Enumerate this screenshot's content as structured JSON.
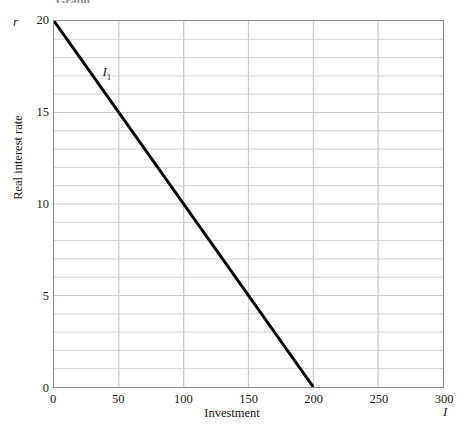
{
  "title_partial": "Graph",
  "chart_data": {
    "type": "line",
    "title": "",
    "xlabel": "Investment",
    "ylabel": "Real interest rate",
    "x_axis_symbol": "I",
    "y_axis_symbol": "r",
    "xlim": [
      0,
      300
    ],
    "ylim": [
      0,
      20
    ],
    "xticks": [
      0,
      50,
      100,
      150,
      200,
      250,
      300
    ],
    "xtick_labels": [
      "0",
      "50",
      "100",
      "150",
      "200",
      "250",
      "300"
    ],
    "yticks": [
      0,
      5,
      10,
      15,
      20
    ],
    "ytick_labels": [
      "0",
      "5",
      "10",
      "15",
      "20"
    ],
    "grid": true,
    "grid_x_step": 50,
    "grid_y_step": 1,
    "grid_color": "#c9c9c9",
    "frame_color": "#8c8c8c",
    "legend": "none",
    "series": [
      {
        "name": "I1",
        "label": "I",
        "label_subscript": "1",
        "color": "#000000",
        "line_width": 3,
        "points": [
          {
            "x": 0,
            "y": 20
          },
          {
            "x": 200,
            "y": 0
          }
        ],
        "annotation_x": 38,
        "annotation_y": 17.2
      }
    ]
  }
}
